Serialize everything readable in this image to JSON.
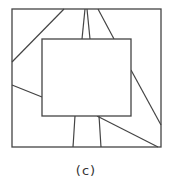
{
  "figure": {
    "caption": "(c)",
    "stroke_color": "#444444",
    "outer_square": {
      "x": 12,
      "y": 9,
      "w": 149,
      "h": 138
    },
    "inner_rect": {
      "x": 42,
      "y": 39,
      "w": 89,
      "h": 77
    },
    "lines": [
      {
        "x1": 64,
        "y1": 9,
        "x2": 12,
        "y2": 62
      },
      {
        "x1": 85,
        "y1": 9,
        "x2": 82,
        "y2": 39
      },
      {
        "x1": 87,
        "y1": 9,
        "x2": 90,
        "y2": 39
      },
      {
        "x1": 98,
        "y1": 9,
        "x2": 114,
        "y2": 39
      },
      {
        "x1": 12,
        "y1": 85,
        "x2": 42,
        "y2": 97
      },
      {
        "x1": 131,
        "y1": 70,
        "x2": 161,
        "y2": 125
      },
      {
        "x1": 75,
        "y1": 116,
        "x2": 73,
        "y2": 147
      },
      {
        "x1": 99,
        "y1": 116,
        "x2": 101,
        "y2": 147
      },
      {
        "x1": 97,
        "y1": 116,
        "x2": 158,
        "y2": 147
      }
    ]
  }
}
